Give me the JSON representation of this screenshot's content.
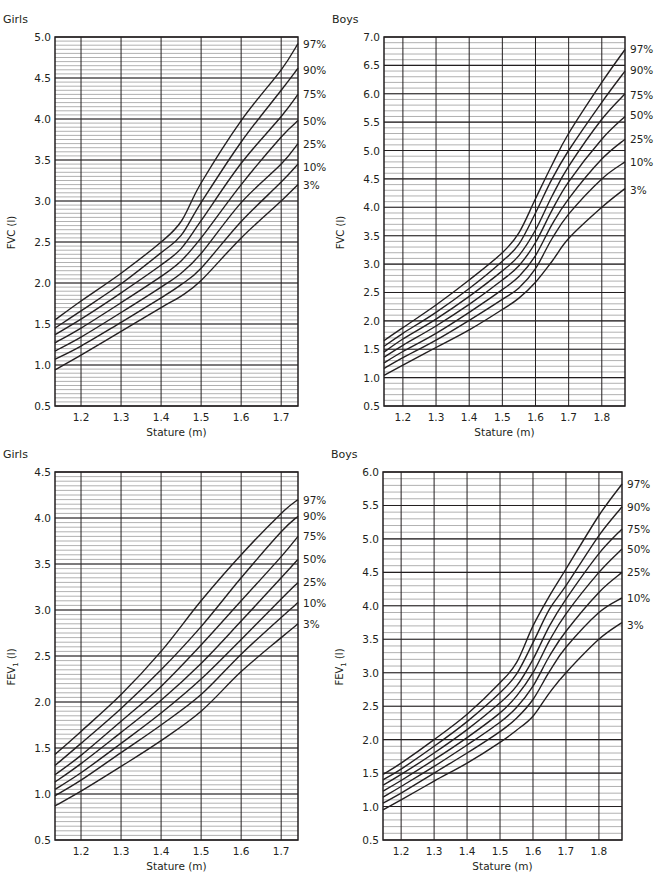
{
  "chart_data": [
    {
      "id": "girls-fvc",
      "type": "line",
      "title": "Girls",
      "xlabel": "Stature (m)",
      "ylabel": "FVC (l)",
      "ylabel_sub": "",
      "xlim": [
        1.135,
        1.742
      ],
      "ylim": [
        0.5,
        5.0
      ],
      "xticks": [
        1.2,
        1.3,
        1.4,
        1.5,
        1.6,
        1.7
      ],
      "yticks": [
        0.5,
        1.0,
        1.5,
        2.0,
        2.5,
        3.0,
        3.5,
        4.0,
        4.5,
        5.0
      ],
      "minor_y_step": 0.05,
      "grid": true,
      "legend_position": "right (curve-end labels)",
      "box": {
        "x": 55,
        "y": 37,
        "w": 243,
        "h": 369
      },
      "x": [
        1.135,
        1.2,
        1.3,
        1.4,
        1.45,
        1.5,
        1.6,
        1.7,
        1.742
      ],
      "series": [
        {
          "name": "97%",
          "values": [
            1.55,
            1.78,
            2.12,
            2.5,
            2.75,
            3.22,
            3.98,
            4.6,
            4.92
          ],
          "label_y": 4.92
        },
        {
          "name": "90%",
          "values": [
            1.45,
            1.66,
            1.99,
            2.37,
            2.58,
            2.98,
            3.72,
            4.35,
            4.62
          ],
          "label_y": 4.6
        },
        {
          "name": "75%",
          "values": [
            1.37,
            1.56,
            1.88,
            2.22,
            2.42,
            2.76,
            3.46,
            4.03,
            4.3
          ],
          "label_y": 4.3
        },
        {
          "name": "50%",
          "values": [
            1.27,
            1.45,
            1.76,
            2.08,
            2.27,
            2.55,
            3.2,
            3.78,
            3.98
          ],
          "label_y": 3.98
        },
        {
          "name": "25%",
          "values": [
            1.17,
            1.34,
            1.64,
            1.95,
            2.12,
            2.36,
            2.98,
            3.45,
            3.7
          ],
          "label_y": 3.7
        },
        {
          "name": "10%",
          "values": [
            1.07,
            1.23,
            1.52,
            1.82,
            1.98,
            2.18,
            2.75,
            3.23,
            3.45
          ],
          "label_y": 3.42
        },
        {
          "name": "3%",
          "values": [
            0.94,
            1.12,
            1.41,
            1.7,
            1.84,
            2.03,
            2.55,
            3.0,
            3.2
          ],
          "label_y": 3.2
        }
      ]
    },
    {
      "id": "boys-fvc",
      "type": "line",
      "title": "Boys",
      "xlabel": "Stature (m)",
      "ylabel": "FVC (l)",
      "ylabel_sub": "",
      "xlim": [
        1.143,
        1.87
      ],
      "ylim": [
        0.5,
        7.0
      ],
      "xticks": [
        1.2,
        1.3,
        1.4,
        1.5,
        1.6,
        1.7,
        1.8
      ],
      "yticks": [
        0.5,
        1.0,
        1.5,
        2.0,
        2.5,
        3.0,
        3.5,
        4.0,
        4.5,
        5.0,
        5.5,
        6.0,
        6.5,
        7.0
      ],
      "minor_y_step": 0.1,
      "grid": true,
      "legend_position": "right (curve-end labels)",
      "box": {
        "x": 384,
        "y": 37,
        "w": 241,
        "h": 369
      },
      "x": [
        1.143,
        1.2,
        1.3,
        1.4,
        1.5,
        1.55,
        1.6,
        1.65,
        1.7,
        1.8,
        1.87
      ],
      "series": [
        {
          "name": "97%",
          "values": [
            1.65,
            1.88,
            2.28,
            2.72,
            3.2,
            3.55,
            4.15,
            4.75,
            5.3,
            6.2,
            6.78
          ],
          "label_y": 6.78
        },
        {
          "name": "90%",
          "values": [
            1.55,
            1.78,
            2.15,
            2.57,
            3.05,
            3.35,
            3.9,
            4.5,
            5.0,
            5.85,
            6.4
          ],
          "label_y": 6.42
        },
        {
          "name": "75%",
          "values": [
            1.45,
            1.68,
            2.03,
            2.43,
            2.88,
            3.15,
            3.6,
            4.2,
            4.72,
            5.55,
            6.0
          ],
          "label_y": 5.98
        },
        {
          "name": "50%",
          "values": [
            1.36,
            1.57,
            1.91,
            2.29,
            2.72,
            2.97,
            3.38,
            3.95,
            4.45,
            5.2,
            5.6
          ],
          "label_y": 5.62
        },
        {
          "name": "25%",
          "values": [
            1.26,
            1.46,
            1.78,
            2.15,
            2.55,
            2.78,
            3.15,
            3.7,
            4.15,
            4.85,
            5.2
          ],
          "label_y": 5.2
        },
        {
          "name": "10%",
          "values": [
            1.16,
            1.35,
            1.66,
            2.01,
            2.38,
            2.58,
            2.92,
            3.45,
            3.88,
            4.5,
            4.8
          ],
          "label_y": 4.8
        },
        {
          "name": "3%",
          "values": [
            1.04,
            1.22,
            1.53,
            1.84,
            2.2,
            2.4,
            2.68,
            3.05,
            3.45,
            4.0,
            4.33
          ],
          "label_y": 4.3
        }
      ]
    },
    {
      "id": "girls-fev1",
      "type": "line",
      "title": "Girls",
      "xlabel": "Stature (m)",
      "ylabel": "FEV",
      "ylabel_sub": "1",
      "ylabel_unit": " (l)",
      "xlim": [
        1.135,
        1.742
      ],
      "ylim": [
        0.5,
        4.5
      ],
      "xticks": [
        1.2,
        1.3,
        1.4,
        1.5,
        1.6,
        1.7
      ],
      "yticks": [
        0.5,
        1.0,
        1.5,
        2.0,
        2.5,
        3.0,
        3.5,
        4.0,
        4.5
      ],
      "minor_y_step": 0.05,
      "grid": true,
      "legend_position": "right (curve-end labels)",
      "box": {
        "x": 55,
        "y": 472,
        "w": 243,
        "h": 368
      },
      "x": [
        1.135,
        1.2,
        1.3,
        1.4,
        1.5,
        1.6,
        1.7,
        1.742
      ],
      "series": [
        {
          "name": "97%",
          "values": [
            1.43,
            1.68,
            2.08,
            2.55,
            3.1,
            3.6,
            4.05,
            4.2
          ],
          "label_y": 4.2
        },
        {
          "name": "90%",
          "values": [
            1.31,
            1.55,
            1.93,
            2.35,
            2.82,
            3.35,
            3.85,
            4.02
          ],
          "label_y": 4.02
        },
        {
          "name": "75%",
          "values": [
            1.21,
            1.42,
            1.79,
            2.17,
            2.62,
            3.1,
            3.58,
            3.8
          ],
          "label_y": 3.8
        },
        {
          "name": "50%",
          "values": [
            1.13,
            1.33,
            1.67,
            2.02,
            2.42,
            2.88,
            3.35,
            3.55
          ],
          "label_y": 3.55
        },
        {
          "name": "25%",
          "values": [
            1.05,
            1.23,
            1.55,
            1.88,
            2.25,
            2.68,
            3.12,
            3.3
          ],
          "label_y": 3.3
        },
        {
          "name": "10%",
          "values": [
            0.98,
            1.15,
            1.45,
            1.75,
            2.08,
            2.52,
            2.92,
            3.08
          ],
          "label_y": 3.08
        },
        {
          "name": "3%",
          "values": [
            0.87,
            1.03,
            1.3,
            1.58,
            1.9,
            2.33,
            2.7,
            2.85
          ],
          "label_y": 2.85
        }
      ]
    },
    {
      "id": "boys-fev1",
      "type": "line",
      "title": "Boys",
      "xlabel": "Stature (m)",
      "ylabel": "FEV",
      "ylabel_sub": "1",
      "ylabel_unit": " (l)",
      "xlim": [
        1.145,
        1.87
      ],
      "ylim": [
        0.5,
        6.0
      ],
      "xticks": [
        1.2,
        1.3,
        1.4,
        1.5,
        1.6,
        1.7,
        1.8
      ],
      "yticks": [
        0.5,
        1.0,
        1.5,
        2.0,
        2.5,
        3.0,
        3.5,
        4.0,
        4.5,
        5.0,
        5.5,
        6.0
      ],
      "minor_y_step": 0.1,
      "grid": true,
      "legend_position": "right (curve-end labels)",
      "box": {
        "x": 383,
        "y": 472,
        "w": 239,
        "h": 368
      },
      "x": [
        1.145,
        1.2,
        1.3,
        1.4,
        1.5,
        1.55,
        1.6,
        1.65,
        1.7,
        1.8,
        1.87
      ],
      "series": [
        {
          "name": "97%",
          "values": [
            1.48,
            1.65,
            2.0,
            2.38,
            2.85,
            3.15,
            3.7,
            4.15,
            4.55,
            5.35,
            5.82
          ],
          "label_y": 5.82
        },
        {
          "name": "90%",
          "values": [
            1.4,
            1.56,
            1.9,
            2.27,
            2.7,
            2.98,
            3.45,
            3.95,
            4.3,
            5.05,
            5.48
          ],
          "label_y": 5.48
        },
        {
          "name": "75%",
          "values": [
            1.32,
            1.48,
            1.8,
            2.15,
            2.55,
            2.8,
            3.2,
            3.7,
            4.1,
            4.78,
            5.15
          ],
          "label_y": 5.15
        },
        {
          "name": "50%",
          "values": [
            1.23,
            1.39,
            1.7,
            2.03,
            2.4,
            2.65,
            3.0,
            3.48,
            3.88,
            4.5,
            4.85
          ],
          "label_y": 4.85
        },
        {
          "name": "25%",
          "values": [
            1.14,
            1.3,
            1.6,
            1.92,
            2.26,
            2.48,
            2.8,
            3.25,
            3.62,
            4.2,
            4.5
          ],
          "label_y": 4.5
        },
        {
          "name": "10%",
          "values": [
            1.05,
            1.2,
            1.5,
            1.8,
            2.12,
            2.32,
            2.6,
            3.02,
            3.38,
            3.9,
            4.12
          ],
          "label_y": 4.12
        },
        {
          "name": "3%",
          "values": [
            0.95,
            1.1,
            1.38,
            1.65,
            1.96,
            2.14,
            2.35,
            2.7,
            3.0,
            3.5,
            3.75
          ],
          "label_y": 3.72
        }
      ]
    }
  ]
}
